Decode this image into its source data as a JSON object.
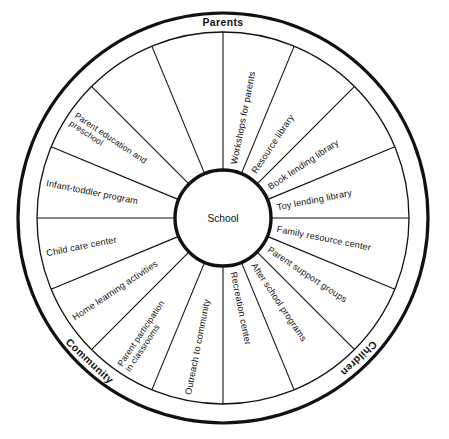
{
  "diagram": {
    "type": "radial-wheel",
    "hub": {
      "label": "School"
    },
    "colors": {
      "stroke": "#111111",
      "background": "#ffffff"
    },
    "geometry": {
      "center_x": 223,
      "center_y": 218,
      "outer_radius": 205,
      "ring_inner_radius": 186,
      "hub_radius": 48,
      "segment_count": 16,
      "start_angle_deg": -90
    },
    "ring_labels": [
      {
        "id": "parents",
        "text": "Parents",
        "angle_deg": -90
      },
      {
        "id": "children",
        "text": "Children",
        "angle_deg": 46
      },
      {
        "id": "community",
        "text": "Community",
        "angle_deg": 133
      }
    ],
    "segments": [
      {
        "index": 0,
        "label": "Workshops for parents",
        "lines": [
          "Workshops for parents"
        ]
      },
      {
        "index": 1,
        "label": "Resource library",
        "lines": [
          "Resource library"
        ]
      },
      {
        "index": 2,
        "label": "Book lending library",
        "lines": [
          "Book lending library"
        ]
      },
      {
        "index": 3,
        "label": "Toy lending library",
        "lines": [
          "Toy lending library"
        ]
      },
      {
        "index": 4,
        "label": "Family resource center",
        "lines": [
          "Family resource center"
        ]
      },
      {
        "index": 5,
        "label": "Parent support groups",
        "lines": [
          "Parent support groups"
        ]
      },
      {
        "index": 6,
        "label": "After school programs",
        "lines": [
          "After school programs"
        ]
      },
      {
        "index": 7,
        "label": "Recreation center",
        "lines": [
          "Recreation center"
        ]
      },
      {
        "index": 8,
        "label": "Outreach to community",
        "lines": [
          "Outreach to community"
        ]
      },
      {
        "index": 9,
        "label": "Parent participation in classrooms",
        "lines": [
          "Parent participation",
          "in classrooms"
        ]
      },
      {
        "index": 10,
        "label": "Home learning activities",
        "lines": [
          "Home learning activities"
        ]
      },
      {
        "index": 11,
        "label": "Child care center",
        "lines": [
          "Child care center"
        ]
      },
      {
        "index": 12,
        "label": "Infant-toddler program",
        "lines": [
          "Infant-toddler program"
        ]
      },
      {
        "index": 13,
        "label": "Parent education and preschool",
        "lines": [
          "Parent education and",
          "preschool"
        ]
      }
    ]
  }
}
